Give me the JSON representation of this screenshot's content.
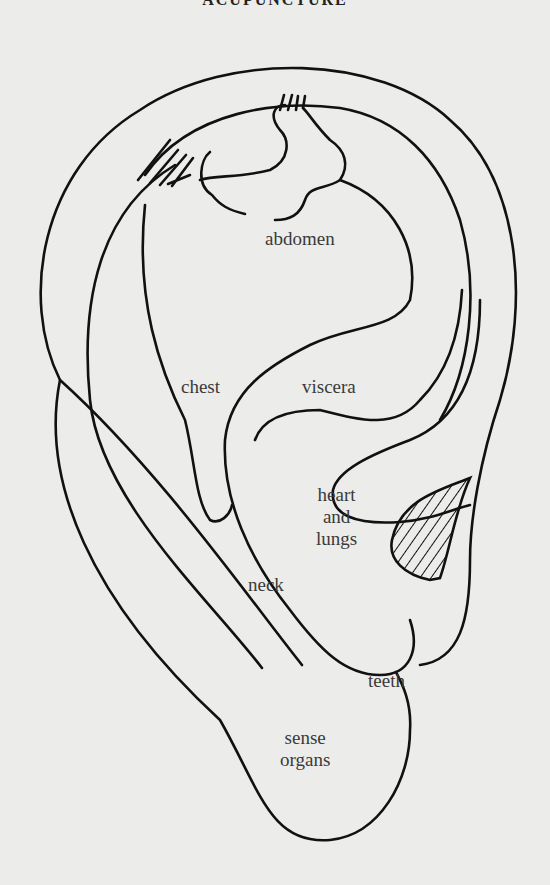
{
  "header": {
    "title": "ACUPUNCTURE"
  },
  "diagram": {
    "labels": {
      "abdomen": "abdomen",
      "chest": "chest",
      "viscera": "viscera",
      "heart_lungs": "heart\nand\nlungs",
      "neck": "neck",
      "teeth": "teeth",
      "sense_organs": "sense\norgans"
    }
  },
  "colors": {
    "line": "#111111",
    "background": "#ececea",
    "text": "#3a3a3a"
  }
}
